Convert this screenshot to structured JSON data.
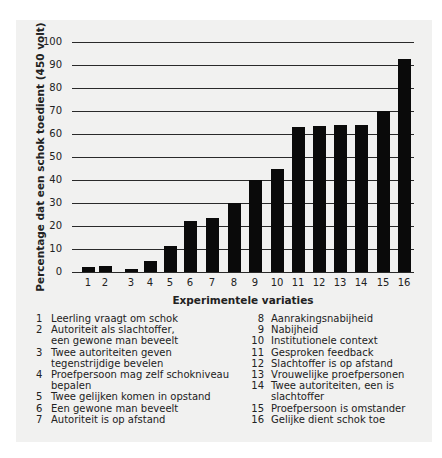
{
  "chart_data": {
    "type": "bar",
    "title": "",
    "xlabel": "Experimentele variaties",
    "ylabel": "Percentage dat een schok toedient (450 volt)",
    "ylim": [
      0,
      100
    ],
    "yticks": [
      0,
      10,
      20,
      30,
      40,
      50,
      60,
      70,
      80,
      90,
      100
    ],
    "grid": true,
    "legend_position": "below",
    "categories": [
      "1",
      "2",
      "3",
      "4",
      "5",
      "6",
      "7",
      "8",
      "9",
      "10",
      "11",
      "12",
      "13",
      "14",
      "15",
      "16"
    ],
    "values": [
      2,
      2.5,
      1.5,
      5,
      11.5,
      22,
      23.5,
      30,
      40,
      45,
      63,
      63.5,
      64,
      64,
      70,
      92.5
    ],
    "bar_color": "#0a0a0a",
    "legend": [
      {
        "num": "1",
        "label": "Leerling vraagt om schok"
      },
      {
        "num": "2",
        "label": "Autoriteit als slachtoffer, een gewone man beveelt"
      },
      {
        "num": "3",
        "label": "Twee autoriteiten geven tegenstrijdige bevelen"
      },
      {
        "num": "4",
        "label": "Proefpersoon mag zelf schokniveau bepalen"
      },
      {
        "num": "5",
        "label": "Twee gelijken komen in opstand"
      },
      {
        "num": "6",
        "label": "Een gewone man beveelt"
      },
      {
        "num": "7",
        "label": "Autoriteit is op afstand"
      },
      {
        "num": "8",
        "label": "Aanrakingsnabijheid"
      },
      {
        "num": "9",
        "label": "Nabijheid"
      },
      {
        "num": "10",
        "label": "Institutionele context"
      },
      {
        "num": "11",
        "label": "Gesproken feedback"
      },
      {
        "num": "12",
        "label": "Slachtoffer is op afstand"
      },
      {
        "num": "13",
        "label": "Vrouwelijke proefpersonen"
      },
      {
        "num": "14",
        "label": "Twee autoriteiten, een is slachtoffer"
      },
      {
        "num": "15",
        "label": "Proefpersoon is omstander"
      },
      {
        "num": "16",
        "label": "Gelijke dient schok toe"
      }
    ]
  },
  "legend_lines": {
    "left": [
      {
        "num": "1",
        "lines": [
          "Leerling vraagt om schok"
        ]
      },
      {
        "num": "2",
        "lines": [
          "Autoriteit als slachtoffer,",
          "een gewone man beveelt"
        ]
      },
      {
        "num": "3",
        "lines": [
          "Twee autoriteiten geven",
          "tegenstrijdige bevelen"
        ]
      },
      {
        "num": "4",
        "lines": [
          "Proefpersoon mag zelf schokniveau",
          "bepalen"
        ]
      },
      {
        "num": "5",
        "lines": [
          "Twee gelijken komen in opstand"
        ]
      },
      {
        "num": "6",
        "lines": [
          "Een gewone man beveelt"
        ]
      },
      {
        "num": "7",
        "lines": [
          "Autoriteit is op afstand"
        ]
      }
    ],
    "right": [
      {
        "num": "8",
        "lines": [
          "Aanrakingsnabijheid"
        ]
      },
      {
        "num": "9",
        "lines": [
          "Nabijheid"
        ]
      },
      {
        "num": "10",
        "lines": [
          "Institutionele context"
        ]
      },
      {
        "num": "11",
        "lines": [
          "Gesproken feedback"
        ]
      },
      {
        "num": "12",
        "lines": [
          "Slachtoffer is op afstand"
        ]
      },
      {
        "num": "13",
        "lines": [
          "Vrouwelijke proefpersonen"
        ]
      },
      {
        "num": "14",
        "lines": [
          "Twee autoriteiten, een is slachtoffer"
        ]
      },
      {
        "num": "15",
        "lines": [
          "Proefpersoon is omstander"
        ]
      },
      {
        "num": "16",
        "lines": [
          "Gelijke dient schok toe"
        ]
      }
    ]
  },
  "layout": {
    "bar_centers_px": [
      88,
      105,
      131,
      150,
      170,
      190,
      212,
      234,
      255,
      277,
      298,
      319,
      340,
      361,
      383,
      404
    ],
    "y0_px": 272,
    "y100_px": 42
  }
}
